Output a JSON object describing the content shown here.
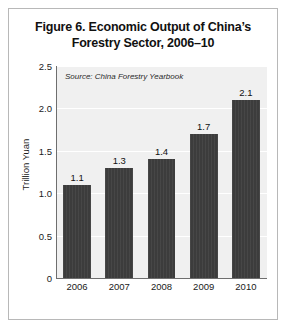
{
  "figure": {
    "title_line1": "Figure 6. Economic Output of China’s",
    "title_line2": "Forestry Sector, 2006–10",
    "source_note": "Source: China Forestry Yearbook"
  },
  "chart_data": {
    "type": "bar",
    "title": "Figure 6. Economic Output of China’s Forestry Sector, 2006–10",
    "categories": [
      "2006",
      "2007",
      "2008",
      "2009",
      "2010"
    ],
    "values": [
      1.1,
      1.3,
      1.4,
      1.7,
      2.1
    ],
    "value_labels": [
      "1.1",
      "1.3",
      "1.4",
      "1.7",
      "2.1"
    ],
    "xlabel": "",
    "ylabel": "Trillion Yuan",
    "ylim": [
      0,
      2.5
    ],
    "yticks": [
      0,
      0.5,
      1.0,
      1.5,
      2.0,
      2.5
    ],
    "ytick_labels": [
      "0",
      "0.5",
      "1.0",
      "1.5",
      "2.0",
      "2.5"
    ],
    "grid": true,
    "legend": false,
    "annotations": [
      "Source: China Forestry Yearbook"
    ],
    "colors": {
      "bar": "#3c3c3c",
      "plot_background": "#f0f0f0",
      "gridline": "#ffffff",
      "axis": "#6e6e6e",
      "text": "#1a1a1a",
      "frame_border": "#b8b8b8"
    }
  }
}
